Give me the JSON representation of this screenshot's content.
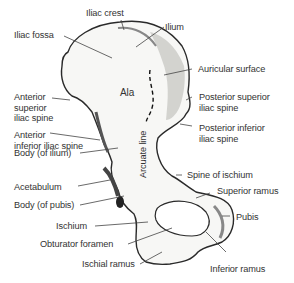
{
  "diagram": {
    "labels": {
      "iliac_crest": "Iliac crest",
      "ilium": "Ilium",
      "iliac_fossa": "Iliac fossa",
      "auricular_surface": "Auricular surface",
      "ala": "Ala",
      "anterior_superior_iliac_spine": "Anterior\nsuperior\niliac spine",
      "posterior_superior_iliac_spine": "Posterior superior\niliac spine",
      "anterior_inferior_iliac_spine": "Anterior\ninferior iliac spine",
      "posterior_inferior_iliac_spine": "Posterior inferior\niliac spine",
      "body_of_ilium": "Body (of ilium)",
      "arcuate_line": "Arcuate line",
      "acetabulum": "Acetabulum",
      "spine_of_ischium": "Spine of ischium",
      "superior_ramus": "Superior ramus",
      "body_of_pubis": "Body (of pubis)",
      "pubis": "Pubis",
      "ischium": "Ischium",
      "obturator_foramen": "Obturator foramen",
      "ischial_ramus": "Ischial ramus",
      "inferior_ramus": "Inferior ramus"
    },
    "colors": {
      "bone_fill": "#f7f7f5",
      "bone_outline": "#2a2a2a",
      "shading": "#9a9a9a",
      "label_text": "#333333",
      "leader_line": "#444444"
    }
  }
}
